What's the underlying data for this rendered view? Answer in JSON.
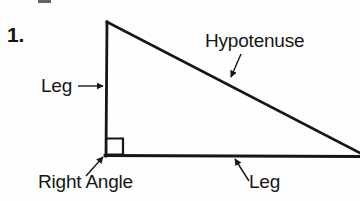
{
  "figure": {
    "item_number": "1.",
    "background_color": "#fefefe",
    "stroke_color": "#161616",
    "width": 360,
    "height": 201,
    "caption_text": "Right triangle labeled with hypotenuse, two legs, and right angle"
  },
  "labels": {
    "leg_vertical": "Leg",
    "hypotenuse": "Hypotenuse",
    "right_angle": "Right Angle",
    "leg_horizontal": "Leg"
  },
  "geometry": {
    "apex": {
      "x": 107,
      "y": 22
    },
    "right_angle_vertex": {
      "x": 106,
      "y": 155
    },
    "far_vertex": {
      "x": 360,
      "y": 156
    },
    "right_angle_marker": {
      "x": 107,
      "y": 138,
      "size": 16
    },
    "line_width": 2.6
  },
  "leaders": {
    "leg_vertical": {
      "from": {
        "x": 78,
        "y": 86
      },
      "to": {
        "x": 103,
        "y": 86
      }
    },
    "hypotenuse": {
      "from": {
        "x": 241,
        "y": 54
      },
      "to": {
        "x": 231,
        "y": 77
      }
    },
    "right_angle": {
      "from": {
        "x": 86,
        "y": 176
      },
      "to": {
        "x": 103,
        "y": 157
      }
    },
    "leg_horizontal": {
      "from": {
        "x": 249,
        "y": 181
      },
      "to": {
        "x": 235,
        "y": 159
      }
    }
  }
}
